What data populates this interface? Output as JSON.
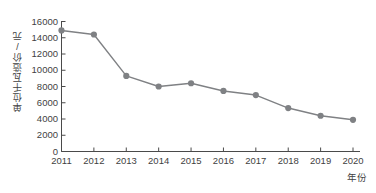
{
  "chart_data": {
    "type": "line",
    "title": "",
    "xlabel": "年份",
    "ylabel": "单位千瓦造价/元",
    "categories": [
      "2011",
      "2012",
      "2013",
      "2014",
      "2015",
      "2016",
      "2017",
      "2018",
      "2019",
      "2020"
    ],
    "values": [
      14900,
      14400,
      9300,
      8000,
      8400,
      7450,
      6950,
      5350,
      4400,
      3900
    ],
    "series": [
      {
        "name": "单位千瓦造价",
        "values": [
          14900,
          14400,
          9300,
          8000,
          8400,
          7450,
          6950,
          5350,
          4400,
          3900
        ]
      }
    ],
    "ylim": [
      0,
      16000
    ],
    "yticks": [
      0,
      2000,
      4000,
      6000,
      8000,
      10000,
      12000,
      14000,
      16000
    ],
    "ytick_labels": [
      "0",
      "2000",
      "4000",
      "6000",
      "8000",
      "10000",
      "12000",
      "14000",
      "16000"
    ],
    "xticks": [
      "2011",
      "2012",
      "2013",
      "2014",
      "2015",
      "2016",
      "2017",
      "2018",
      "2019",
      "2020"
    ],
    "grid": false,
    "legend": false,
    "legend_position": "none",
    "marker": "circle",
    "line_color": "#7f8184",
    "marker_color": "#7f8184",
    "axis_color": "#4a4a4a",
    "background_color": "#ffffff",
    "annotations": []
  },
  "axes": {
    "y_title": "单位千瓦造价/元",
    "x_title": "年份"
  }
}
